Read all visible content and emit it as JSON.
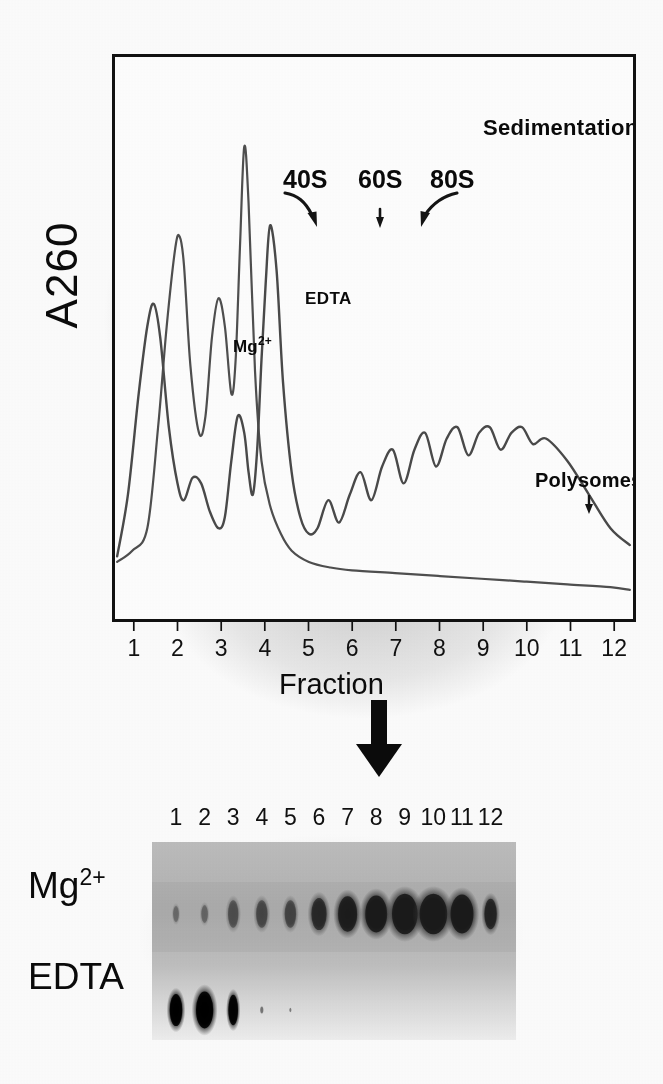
{
  "figure": {
    "type": "polysome-profile-with-blot",
    "axis": {
      "ylabel": "A260",
      "xlabel": "Fraction",
      "x_ticks": [
        "1",
        "2",
        "3",
        "4",
        "5",
        "6",
        "7",
        "8",
        "9",
        "10",
        "11",
        "12"
      ]
    },
    "annotations": {
      "sedimentation": "Sedimentation",
      "peak_40s": "40S",
      "peak_60s": "60S",
      "peak_80s": "80S",
      "trace_edta": "EDTA",
      "trace_mg": "Mg",
      "trace_mg_sup": "2+",
      "polysomes": "Polysomes"
    },
    "blot": {
      "lane_numbers": [
        "1",
        "2",
        "3",
        "4",
        "5",
        "6",
        "7",
        "8",
        "9",
        "10",
        "11",
        "12"
      ],
      "row_mg_label": "Mg",
      "row_mg_sup": "2+",
      "row_edta_label": "EDTA"
    },
    "colors": {
      "ink": "#0a0a0a",
      "frame": "#111111",
      "trace": "#4a4a4a",
      "blot_background": "#c9c9c9",
      "band_dark": "#0d0d0d",
      "paper": "#fdfdfd",
      "smudge": "#b9b9b9"
    }
  },
  "chart_data": {
    "type": "line",
    "title": "",
    "xlabel": "Fraction",
    "ylabel": "A260",
    "xlim": [
      0.5,
      12.5
    ],
    "ylim": [
      0,
      1
    ],
    "grid": false,
    "legend": "in-plot trace labels",
    "x_tick_labels": [
      "1",
      "2",
      "3",
      "4",
      "5",
      "6",
      "7",
      "8",
      "9",
      "10",
      "11",
      "12"
    ],
    "annotations": [
      {
        "text": "Sedimentation",
        "kind": "direction-arrow",
        "x": 9.2,
        "y": 0.95
      },
      {
        "text": "40S",
        "kind": "peak-arrow",
        "x": 2.05,
        "y": 0.88
      },
      {
        "text": "60S",
        "kind": "peak-arrow",
        "x": 3.05,
        "y": 0.88
      },
      {
        "text": "80S",
        "kind": "peak-arrow",
        "x": 3.95,
        "y": 0.88
      },
      {
        "text": "Polysomes",
        "kind": "region-arrow",
        "x": 8.2,
        "y": 0.38
      },
      {
        "text": "EDTA",
        "kind": "trace-label",
        "x": 2.35,
        "y": 0.63
      },
      {
        "text": "Mg2+",
        "kind": "trace-label",
        "x": 1.35,
        "y": 0.54
      }
    ],
    "series": [
      {
        "name": "EDTA",
        "comment": "sharp 40S and 60S subunit peaks, no polysomes, flat low baseline after fraction 5",
        "x": [
          0.55,
          0.9,
          1.25,
          1.5,
          1.7,
          1.9,
          2.0,
          2.1,
          2.25,
          2.45,
          2.6,
          2.75,
          2.9,
          3.05,
          3.2,
          3.3,
          3.4,
          3.5,
          3.6,
          3.75,
          3.9,
          4.1,
          4.35,
          4.6,
          5.0,
          5.5,
          6.0,
          7.0,
          8.0,
          9.0,
          10.0,
          11.0,
          12.0,
          12.45
        ],
        "y": [
          0.1,
          0.12,
          0.16,
          0.34,
          0.52,
          0.66,
          0.68,
          0.63,
          0.45,
          0.33,
          0.36,
          0.5,
          0.57,
          0.52,
          0.4,
          0.46,
          0.66,
          0.84,
          0.74,
          0.44,
          0.28,
          0.2,
          0.15,
          0.12,
          0.1,
          0.09,
          0.085,
          0.08,
          0.075,
          0.07,
          0.065,
          0.06,
          0.055,
          0.05
        ]
      },
      {
        "name": "Mg2+",
        "comment": "smaller subunit peaks, dominant 80S monosome peak near fraction 4, then regular polysome peaks fractions 5-10, decaying tail",
        "x": [
          0.55,
          0.8,
          1.05,
          1.25,
          1.4,
          1.55,
          1.75,
          1.95,
          2.1,
          2.3,
          2.5,
          2.7,
          2.9,
          3.05,
          3.2,
          3.35,
          3.5,
          3.6,
          3.7,
          3.8,
          3.9,
          4.0,
          4.1,
          4.25,
          4.4,
          4.6,
          4.8,
          5.0,
          5.2,
          5.45,
          5.7,
          5.95,
          6.2,
          6.45,
          6.7,
          6.95,
          7.2,
          7.45,
          7.7,
          7.95,
          8.2,
          8.45,
          8.7,
          8.95,
          9.2,
          9.45,
          9.7,
          9.95,
          10.2,
          10.5,
          11.0,
          11.5,
          12.0,
          12.45
        ],
        "y": [
          0.11,
          0.22,
          0.4,
          0.52,
          0.56,
          0.5,
          0.34,
          0.24,
          0.21,
          0.25,
          0.24,
          0.19,
          0.16,
          0.18,
          0.28,
          0.36,
          0.33,
          0.26,
          0.22,
          0.3,
          0.46,
          0.6,
          0.7,
          0.62,
          0.42,
          0.26,
          0.18,
          0.15,
          0.16,
          0.21,
          0.17,
          0.22,
          0.26,
          0.21,
          0.27,
          0.3,
          0.24,
          0.3,
          0.33,
          0.27,
          0.32,
          0.34,
          0.29,
          0.33,
          0.34,
          0.3,
          0.33,
          0.34,
          0.31,
          0.32,
          0.28,
          0.22,
          0.16,
          0.13
        ]
      }
    ]
  },
  "blot_data": {
    "type": "autoradiograph",
    "lanes": [
      "1",
      "2",
      "3",
      "4",
      "5",
      "6",
      "7",
      "8",
      "9",
      "10",
      "11",
      "12"
    ],
    "rows": [
      {
        "name": "Mg",
        "label_sup": "2+",
        "comment": "signal increases toward high-numbered polysome fractions",
        "intensity": [
          0.04,
          0.07,
          0.22,
          0.28,
          0.3,
          0.58,
          0.8,
          0.88,
          0.97,
          1.0,
          0.92,
          0.66
        ],
        "band_width": [
          6,
          7,
          11,
          12,
          12,
          16,
          20,
          23,
          27,
          29,
          24,
          13
        ],
        "band_height": [
          20,
          22,
          34,
          34,
          34,
          40,
          44,
          46,
          50,
          50,
          48,
          38
        ]
      },
      {
        "name": "EDTA",
        "label_sup": "",
        "comment": "signal confined to the free-mRNP / subunit fractions 1-3",
        "intensity": [
          0.88,
          1.0,
          0.82,
          0.05,
          0.02,
          0.01,
          0.0,
          0.0,
          0.0,
          0.0,
          0.0,
          0.0
        ],
        "band_width": [
          13,
          18,
          10,
          3,
          2,
          1,
          0,
          0,
          0,
          0,
          0,
          0
        ],
        "band_height": [
          40,
          46,
          38,
          8,
          5,
          3,
          0,
          0,
          0,
          0,
          0,
          0
        ]
      }
    ]
  },
  "ghost_text": {
    "line1": "in before or bleed",
    "line2": "through from page back"
  }
}
